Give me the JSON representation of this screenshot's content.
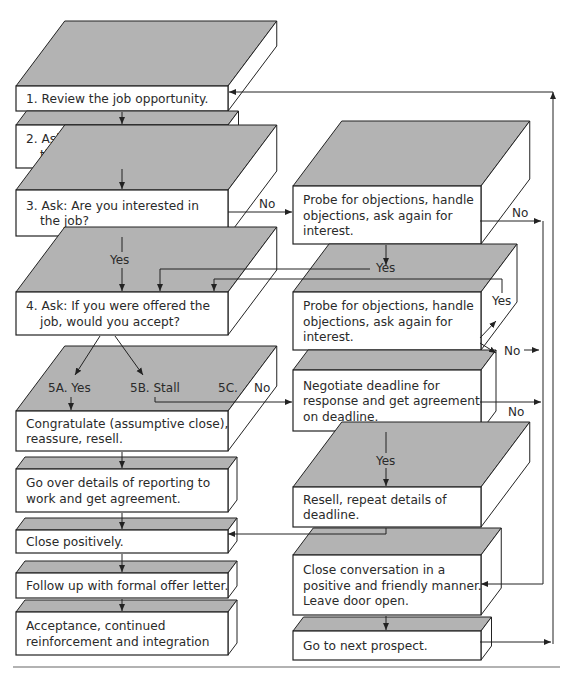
{
  "diagram": {
    "left_steps": [
      {
        "id": "step-1",
        "lines": [
          "1. Review the job opportunity."
        ]
      },
      {
        "id": "step-2",
        "lines": [
          "2. Ask for questions and answer",
          "    them to prospect’s satisfaction."
        ]
      },
      {
        "id": "step-3",
        "lines": [
          "3. Ask: Are you interested in",
          "    the job?"
        ]
      },
      {
        "id": "step-4",
        "lines": [
          "4. Ask: If you were offered the",
          "    job, would you accept?"
        ]
      },
      {
        "id": "step-5a",
        "lines": [
          "Congratulate (assumptive close),",
          "reassure, resell."
        ]
      },
      {
        "id": "step-6",
        "lines": [
          "Go over details of reporting to",
          "work and get agreement."
        ]
      },
      {
        "id": "step-7",
        "lines": [
          "Close positively."
        ]
      },
      {
        "id": "step-8",
        "lines": [
          "Follow up with formal offer letter."
        ]
      },
      {
        "id": "step-9",
        "lines": [
          "Acceptance, continued",
          "reinforcement and integration"
        ]
      }
    ],
    "right_steps": [
      {
        "id": "probe-1",
        "lines": [
          "Probe for objections, handle",
          "objections, ask again for",
          "interest."
        ]
      },
      {
        "id": "probe-2",
        "lines": [
          "Probe for objections, handle",
          "objections, ask again for",
          "interest."
        ]
      },
      {
        "id": "negotiate",
        "lines": [
          "Negotiate deadline for",
          "response and get agreement",
          "on deadline."
        ]
      },
      {
        "id": "resell",
        "lines": [
          "Resell, repeat details of",
          "deadline."
        ]
      },
      {
        "id": "close-conversation",
        "lines": [
          "Close conversation in a",
          "positive and friendly manner.",
          "Leave door open."
        ]
      },
      {
        "id": "next-prospect",
        "lines": [
          "Go to next prospect."
        ]
      }
    ],
    "edge_labels": {
      "step3_no": "No",
      "step3_yes": "Yes",
      "probe1_no": "No",
      "probe1_yes": "Yes",
      "probe2_yes": "Yes",
      "probe2_no": "No",
      "option_5a": "5A. Yes",
      "option_5b": "5B. Stall",
      "option_5c": "5C.",
      "option_5c_no": "No",
      "negotiate_no": "No",
      "negotiate_yes": "Yes"
    }
  }
}
